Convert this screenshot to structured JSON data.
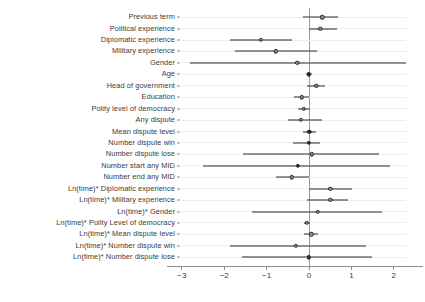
{
  "chart_data": {
    "type": "scatter",
    "subtype": "forest-plot-coefficient-plot",
    "title": "",
    "xlabel": "",
    "ylabel": "",
    "xlim": [
      -3.35,
      2.7
    ],
    "xticks": [
      -3,
      -2,
      -1,
      0,
      1,
      2
    ],
    "xticklabels": [
      "−3",
      "−2",
      "−1",
      "0",
      "1",
      "2"
    ],
    "grid": "horizontal",
    "reference_line": 0,
    "legend": "none",
    "categories": [
      "Previous term",
      "Political experience",
      "Diplomatic experience",
      "Military experience",
      "Gender",
      "Age",
      "Head of government",
      "Education",
      "Polity level of democracy",
      "Any dispute",
      "Mean dispute level",
      "Number dispute win",
      "Number dispute lose",
      "Number start any MID",
      "Number end any MID",
      "Ln(time)* Diplomatic experience",
      "Ln(time)* Military experience",
      "Ln(time)* Gender",
      "Ln(time)* Polity Level of democracy",
      "Ln(time)* Mean dispute level",
      "Ln(time)* Number dispute win",
      "Ln(time)* Number dispute lose"
    ],
    "estimates": [
      0.31,
      0.27,
      -1.13,
      -0.78,
      -0.28,
      0.0,
      0.17,
      -0.17,
      -0.12,
      -0.19,
      0.01,
      0.0,
      0.07,
      -0.26,
      -0.4,
      0.5,
      0.5,
      0.21,
      -0.05,
      0.05,
      -0.31,
      0.0
    ],
    "ci_low": [
      -0.15,
      -0.01,
      -1.86,
      -1.74,
      -2.8,
      -0.07,
      -0.05,
      -0.35,
      -0.26,
      -0.49,
      -0.14,
      -0.38,
      -1.55,
      -2.49,
      -0.78,
      0.0,
      -0.05,
      -1.34,
      -0.12,
      -0.12,
      -1.86,
      -1.58
    ],
    "ci_high": [
      0.69,
      0.66,
      -0.4,
      0.18,
      2.28,
      0.07,
      0.38,
      0.0,
      0.02,
      0.31,
      0.16,
      0.26,
      1.64,
      1.91,
      -0.01,
      1.01,
      0.92,
      1.72,
      0.02,
      0.21,
      1.34,
      1.48
    ],
    "marker_fill": [
      "open",
      "open",
      "open",
      "open",
      "open",
      "solid",
      "open",
      "open",
      "open",
      "open",
      "solid",
      "solid",
      "open",
      "solid",
      "open",
      "open",
      "open",
      "open",
      "open",
      "open",
      "open",
      "solid"
    ]
  },
  "style": {
    "grid_color": "#ededed",
    "zero_line_color": "#9a9a9a",
    "line_color": "#2b2b2b",
    "marker_face": "#8f8f8f",
    "text_color": "#3a3a3a",
    "background": "#ffffff"
  }
}
